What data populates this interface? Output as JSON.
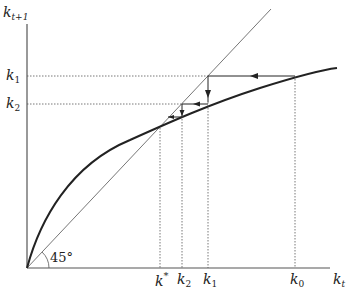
{
  "diagram": {
    "y_axis_label": {
      "base": "k",
      "sub": "t+1"
    },
    "x_axis_label": {
      "base": "k",
      "sub": "t"
    },
    "angle_label": "45°",
    "y_ticks": [
      {
        "base": "k",
        "sub": "1"
      },
      {
        "base": "k",
        "sub": "2"
      }
    ],
    "x_ticks": [
      {
        "base": "k",
        "sup": "*"
      },
      {
        "base": "k",
        "sub": "2"
      },
      {
        "base": "k",
        "sub": "1"
      },
      {
        "base": "k",
        "sub": "0"
      }
    ],
    "colors": {
      "curve": "#222222",
      "axes": "#555555",
      "guide": "#555555",
      "dotted": "#555555"
    }
  }
}
